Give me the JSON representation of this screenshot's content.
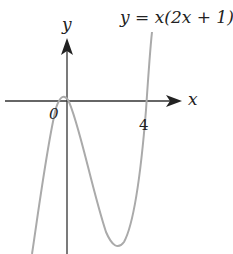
{
  "diagram": {
    "equation": "y = x(2x + 1)(x −",
    "x_axis_label": "x",
    "y_axis_label": "y",
    "origin_label": "0",
    "tick_label_4": "4",
    "colors": {
      "axis": "#333333",
      "curve": "#aaaaaa",
      "text": "#222222"
    }
  }
}
